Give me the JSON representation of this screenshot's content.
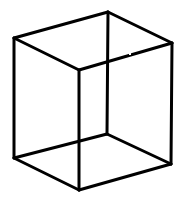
{
  "figure": {
    "line_color": "#000000",
    "background_color": "#ffffff",
    "vertices": [
      {
        "id": "top-left"
      },
      {
        "id": "top-back"
      },
      {
        "id": "top-right"
      },
      {
        "id": "top-front"
      },
      {
        "id": "bottom-left"
      },
      {
        "id": "bottom-back"
      },
      {
        "id": "bottom-right"
      },
      {
        "id": "bottom-front"
      }
    ],
    "edges": [
      {
        "name": "edge-top-left-top-back",
        "from": "top-left",
        "to": "top-back"
      },
      {
        "name": "edge-top-back-top-right",
        "from": "top-back",
        "to": "top-right"
      },
      {
        "name": "edge-top-right-top-front",
        "from": "top-right",
        "to": "top-front"
      },
      {
        "name": "edge-top-front-top-left",
        "from": "top-front",
        "to": "top-left"
      },
      {
        "name": "edge-bottom-left-bottom-back",
        "from": "bottom-left",
        "to": "bottom-back"
      },
      {
        "name": "edge-bottom-back-bottom-right",
        "from": "bottom-back",
        "to": "bottom-right"
      },
      {
        "name": "edge-bottom-right-bottom-front",
        "from": "bottom-right",
        "to": "bottom-front"
      },
      {
        "name": "edge-bottom-front-bottom-left",
        "from": "bottom-front",
        "to": "bottom-left"
      },
      {
        "name": "edge-vertical-left",
        "from": "top-left",
        "to": "bottom-left"
      },
      {
        "name": "edge-vertical-back",
        "from": "top-back",
        "to": "bottom-back"
      },
      {
        "name": "edge-vertical-right",
        "from": "top-right",
        "to": "bottom-right"
      },
      {
        "name": "edge-vertical-front",
        "from": "top-front",
        "to": "bottom-front"
      }
    ]
  }
}
